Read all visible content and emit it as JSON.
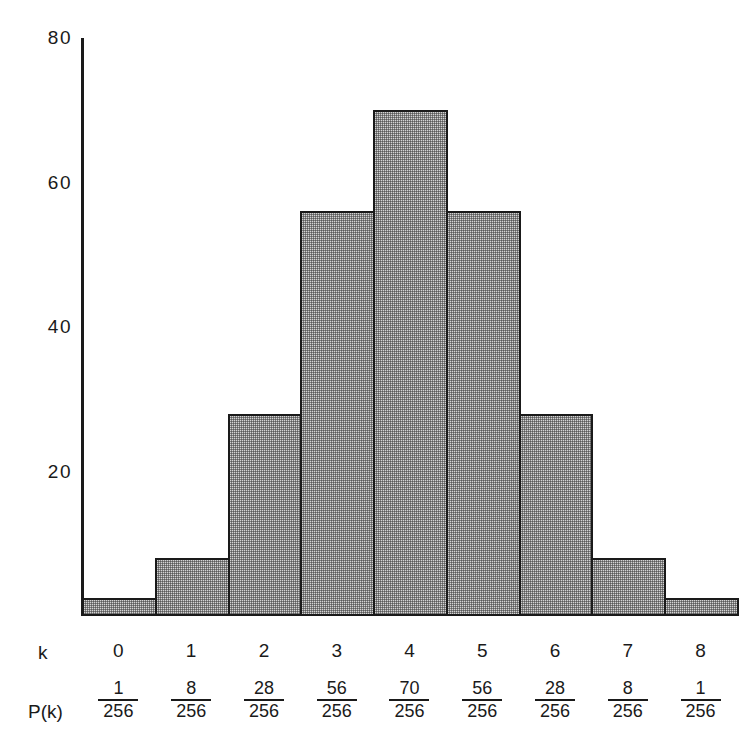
{
  "chart_data": {
    "type": "bar",
    "title": "",
    "xlabel": "k",
    "ylabel": "",
    "categories": [
      "0",
      "1",
      "2",
      "3",
      "4",
      "5",
      "6",
      "7",
      "8"
    ],
    "values": [
      1,
      8,
      28,
      56,
      70,
      56,
      28,
      8,
      1
    ],
    "ylim": [
      0,
      80
    ],
    "y_ticks": [
      20,
      40,
      60,
      80
    ],
    "y_tick_labels": [
      "20",
      "40",
      "60",
      "80"
    ],
    "grid": false,
    "legend": false,
    "bar_fill_color": "#d3d3d3",
    "bar_edge_color": "#1a1a1a",
    "axis_color": "#1a1a1a",
    "probabilities": [
      {
        "numerator": "1",
        "denominator": "256"
      },
      {
        "numerator": "8",
        "denominator": "256"
      },
      {
        "numerator": "28",
        "denominator": "256"
      },
      {
        "numerator": "56",
        "denominator": "256"
      },
      {
        "numerator": "70",
        "denominator": "256"
      },
      {
        "numerator": "56",
        "denominator": "256"
      },
      {
        "numerator": "28",
        "denominator": "256"
      },
      {
        "numerator": "8",
        "denominator": "256"
      },
      {
        "numerator": "1",
        "denominator": "256"
      }
    ]
  },
  "axis": {
    "y_labels": [
      {
        "text": "80",
        "value": 80
      },
      {
        "text": "60",
        "value": 60
      },
      {
        "text": "40",
        "value": 40
      },
      {
        "text": "20",
        "value": 20
      }
    ]
  },
  "table": {
    "k_row_label": "k",
    "pk_row_label": "P(k)",
    "k_values": [
      "0",
      "1",
      "2",
      "3",
      "4",
      "5",
      "6",
      "7",
      "8"
    ],
    "pk_numerators": [
      "1",
      "8",
      "28",
      "56",
      "70",
      "56",
      "28",
      "8",
      "1"
    ],
    "pk_denominators": [
      "256",
      "256",
      "256",
      "256",
      "256",
      "256",
      "256",
      "256",
      "256"
    ]
  }
}
